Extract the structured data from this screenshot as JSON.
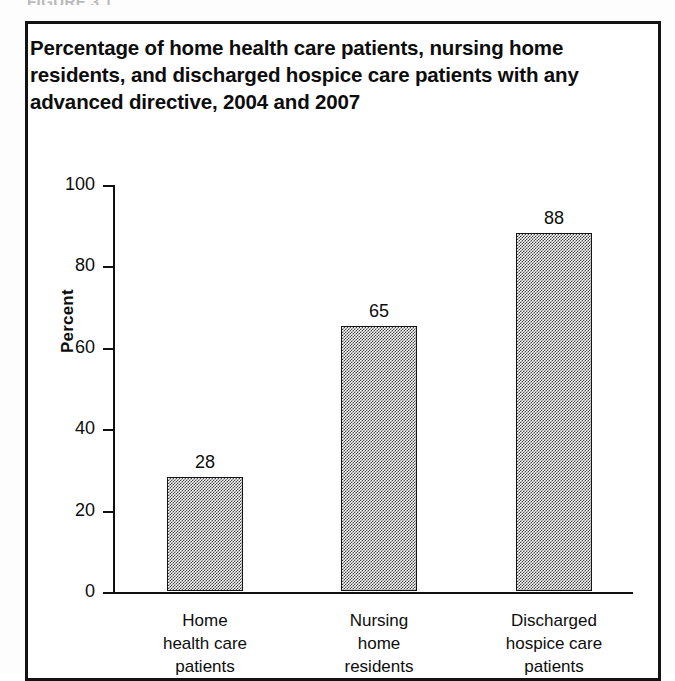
{
  "figure_label": "FIGURE 3.1",
  "title": "Percentage of home health care patients, nursing home\nresidents, and discharged hospice care patients with any\nadvanced directive, 2004 and 2007",
  "colors": {
    "ink": "#101010",
    "bar_fill": "#808080",
    "bar_stroke": "#141414",
    "background": "#ffffff"
  },
  "chart_data": {
    "type": "bar",
    "title": "Percentage of home health care patients, nursing home residents, and discharged hospice care patients with any advanced directive, 2004 and 2007",
    "xlabel": "",
    "ylabel": "Percent",
    "ylim": [
      0,
      100
    ],
    "yticks": [
      0,
      20,
      40,
      60,
      80,
      100
    ],
    "ytick_labels": [
      "0",
      "20",
      "40",
      "60",
      "80",
      "100"
    ],
    "grid": false,
    "legend": "none",
    "categories": [
      "Home\nhealth care\npatients",
      "Nursing\nhome\nresidents",
      "Discharged\nhospice care\npatients"
    ],
    "values": [
      28,
      65,
      88
    ],
    "value_labels": [
      "28",
      "65",
      "88"
    ]
  }
}
